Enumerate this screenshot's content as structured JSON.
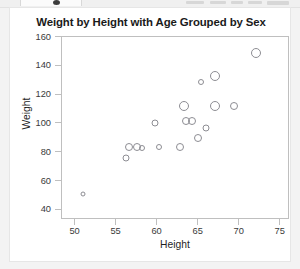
{
  "window": {
    "chrome_visible": "partial-toolbar-strip"
  },
  "figure": {
    "title": "Weight by Height with Age Grouped by Sex",
    "marker_color": "#8d8d93",
    "frame_color": "#bfbfbf",
    "background": "#ffffff"
  },
  "axes": {
    "x_label": "Height",
    "y_label": "Weight",
    "x_ticks": [
      "50",
      "55",
      "60",
      "65",
      "70",
      "75"
    ],
    "y_ticks": [
      "160",
      "140",
      "120",
      "100",
      "80",
      "60",
      "40"
    ]
  },
  "chart_data": {
    "type": "scatter",
    "title": "Weight by Height with Age Grouped by Sex",
    "xlabel": "Height",
    "ylabel": "Weight",
    "xlim": [
      48.4,
      76.2
    ],
    "ylim": [
      33,
      160
    ],
    "xticks": [
      50,
      55,
      60,
      65,
      70,
      75
    ],
    "yticks": [
      40,
      60,
      80,
      100,
      120,
      140,
      160
    ],
    "grid": false,
    "legend": null,
    "size_encodes": "Age",
    "points": [
      {
        "x": 72.0,
        "y": 149,
        "size": 10
      },
      {
        "x": 67.0,
        "y": 133,
        "size": 10
      },
      {
        "x": 65.3,
        "y": 129,
        "size": 6
      },
      {
        "x": 63.3,
        "y": 112,
        "size": 10
      },
      {
        "x": 67.0,
        "y": 112,
        "size": 10
      },
      {
        "x": 69.4,
        "y": 112,
        "size": 8
      },
      {
        "x": 63.5,
        "y": 102,
        "size": 8
      },
      {
        "x": 64.3,
        "y": 102,
        "size": 8
      },
      {
        "x": 59.8,
        "y": 100,
        "size": 7
      },
      {
        "x": 66.0,
        "y": 97,
        "size": 7
      },
      {
        "x": 65.0,
        "y": 90,
        "size": 8
      },
      {
        "x": 56.6,
        "y": 84,
        "size": 8
      },
      {
        "x": 57.6,
        "y": 84,
        "size": 8
      },
      {
        "x": 58.2,
        "y": 83,
        "size": 6
      },
      {
        "x": 60.2,
        "y": 84,
        "size": 6
      },
      {
        "x": 62.8,
        "y": 84,
        "size": 8
      },
      {
        "x": 56.2,
        "y": 76,
        "size": 7
      },
      {
        "x": 51.0,
        "y": 51,
        "size": 5
      }
    ]
  }
}
